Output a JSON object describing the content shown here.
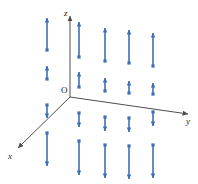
{
  "figure": {
    "background_color": "#ffffff",
    "width": 198,
    "height": 184
  },
  "axes": {
    "color": "#4d4d4d",
    "origin": {
      "x": 70,
      "y": 97,
      "label": "O"
    },
    "z": {
      "label": "z",
      "from": {
        "x": 70,
        "y": 97
      },
      "to": {
        "x": 70,
        "y": 16
      },
      "arrowhead": true,
      "label_pos": {
        "x": 64,
        "y": 9
      }
    },
    "y": {
      "label": "y",
      "from": {
        "x": 70,
        "y": 97
      },
      "to": {
        "x": 188,
        "y": 114
      },
      "arrowhead": true,
      "label_pos": {
        "x": 186,
        "y": 117
      }
    },
    "x": {
      "label": "x",
      "from": {
        "x": 70,
        "y": 97
      },
      "to": {
        "x": 18,
        "y": 148
      },
      "arrowhead": true,
      "label_pos": {
        "x": 8,
        "y": 152
      }
    }
  },
  "vector_field": {
    "color": "#3f6fb5",
    "stroke_width": 1.6,
    "arrowhead_size": 4,
    "description": "Each of five columns contains two upward vectors above the xy-plane and two downward vectors below it; magnitude grows with distance from the plane.",
    "columns": [
      {
        "id": "column-1",
        "x": 47,
        "arrows": [
          {
            "id": "c1-a1",
            "direction": "up",
            "tail_y": 50,
            "tip_y": 18,
            "length": 32
          },
          {
            "id": "c1-a2",
            "direction": "up",
            "tail_y": 79,
            "tip_y": 66,
            "length": 13
          },
          {
            "id": "c1-a3",
            "direction": "down",
            "tail_y": 105,
            "tip_y": 118,
            "length": 13
          },
          {
            "id": "c1-a4",
            "direction": "down",
            "tail_y": 133,
            "tip_y": 166,
            "length": 33
          }
        ]
      },
      {
        "id": "column-2",
        "x": 79,
        "arrows": [
          {
            "id": "c2-a1",
            "direction": "up",
            "tail_y": 57,
            "tip_y": 22,
            "length": 35
          },
          {
            "id": "c2-a2",
            "direction": "up",
            "tail_y": 87,
            "tip_y": 72,
            "length": 15
          },
          {
            "id": "c2-a3",
            "direction": "down",
            "tail_y": 113,
            "tip_y": 127,
            "length": 14
          },
          {
            "id": "c2-a4",
            "direction": "down",
            "tail_y": 141,
            "tip_y": 175,
            "length": 34
          }
        ]
      },
      {
        "id": "column-3",
        "x": 105,
        "arrows": [
          {
            "id": "c3-a1",
            "direction": "up",
            "tail_y": 61,
            "tip_y": 28,
            "length": 33
          },
          {
            "id": "c3-a2",
            "direction": "up",
            "tail_y": 91,
            "tip_y": 78,
            "length": 13
          },
          {
            "id": "c3-a3",
            "direction": "down",
            "tail_y": 117,
            "tip_y": 131,
            "length": 14
          },
          {
            "id": "c3-a4",
            "direction": "down",
            "tail_y": 145,
            "tip_y": 178,
            "length": 33
          }
        ]
      },
      {
        "id": "column-4",
        "x": 129,
        "arrows": [
          {
            "id": "c4-a1",
            "direction": "up",
            "tail_y": 63,
            "tip_y": 30,
            "length": 33
          },
          {
            "id": "c4-a2",
            "direction": "up",
            "tail_y": 93,
            "tip_y": 81,
            "length": 12
          },
          {
            "id": "c4-a3",
            "direction": "down",
            "tail_y": 118,
            "tip_y": 132,
            "length": 14
          },
          {
            "id": "c4-a4",
            "direction": "down",
            "tail_y": 146,
            "tip_y": 179,
            "length": 33
          }
        ]
      },
      {
        "id": "column-5",
        "x": 153,
        "arrows": [
          {
            "id": "c5-a1",
            "direction": "up",
            "tail_y": 66,
            "tip_y": 33,
            "length": 33
          },
          {
            "id": "c5-a2",
            "direction": "up",
            "tail_y": 94,
            "tip_y": 83,
            "length": 11
          },
          {
            "id": "c5-a3",
            "direction": "down",
            "tail_y": 112,
            "tip_y": 126,
            "length": 14
          },
          {
            "id": "c5-a4",
            "direction": "down",
            "tail_y": 145,
            "tip_y": 178,
            "length": 33
          }
        ]
      }
    ]
  }
}
